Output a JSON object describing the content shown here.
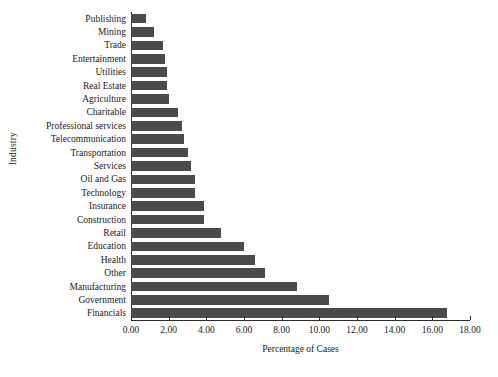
{
  "chart_data": {
    "type": "bar",
    "orientation": "horizontal",
    "title": "",
    "xlabel": "Percentage of Cases",
    "ylabel": "Industry",
    "xlim": [
      0.0,
      18.0
    ],
    "xticks": [
      "0.00",
      "2.00",
      "4.00",
      "6.00",
      "8.00",
      "10.00",
      "12.00",
      "14.00",
      "16.00",
      "18.00"
    ],
    "xtick_values": [
      0,
      2,
      4,
      6,
      8,
      10,
      12,
      14,
      16,
      18
    ],
    "grid": false,
    "legend": null,
    "bar_color": "#4b4b4b",
    "axis_color": "#2b2b2b",
    "categories": [
      "Publishing",
      "Mining",
      "Trade",
      "Entertainment",
      "Utilities",
      "Real Estate",
      "Agriculture",
      "Charitable",
      "Professional services",
      "Telecommunication",
      "Transportation",
      "Services",
      "Oil and Gas",
      "Technology",
      "Insurance",
      "Construction",
      "Retail",
      "Education",
      "Health",
      "Other",
      "Manufacturing",
      "Government",
      "Financials"
    ],
    "values": [
      0.8,
      1.2,
      1.7,
      1.8,
      1.9,
      1.9,
      2.0,
      2.5,
      2.7,
      2.8,
      3.0,
      3.2,
      3.4,
      3.4,
      3.9,
      3.9,
      4.8,
      6.0,
      6.6,
      7.1,
      8.8,
      10.5,
      16.8
    ]
  }
}
